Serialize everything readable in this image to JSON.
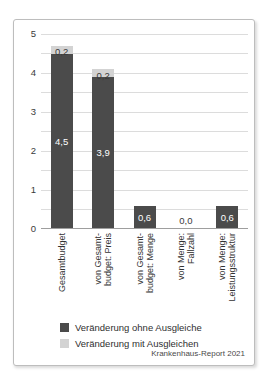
{
  "card": {
    "border_color": "#bdbdbd",
    "background": "#ffffff"
  },
  "chart_data": {
    "type": "bar",
    "stacked": true,
    "categories": [
      "Gesamtbudget",
      "von Gesamtbudget: Preis",
      "von Gesamtbudget: Menge",
      "von Menge: Fallzahl",
      "von Menge: Leistungsstruktur"
    ],
    "category_display_lines": [
      [
        "Gesamtbudget"
      ],
      [
        "von Gesamt-",
        "budget: Preis"
      ],
      [
        "von Gesamt-",
        "budget: Menge"
      ],
      [
        "von Menge:",
        "Fallzahl"
      ],
      [
        "von Menge:",
        "Leistungsstruktur"
      ]
    ],
    "series": [
      {
        "name": "Veränderung ohne Ausgleiche",
        "color": "#4b4b4b",
        "values": [
          4.5,
          3.9,
          0.6,
          0.0,
          0.6
        ],
        "labels": [
          "4,5",
          "3,9",
          "0,6",
          "0,0",
          "0,6"
        ],
        "label_color_inside": "#ffffff",
        "label_color_outside": "#3a3a3a"
      },
      {
        "name": "Veränderung mit Ausgleichen",
        "color": "#d3d3d3",
        "values": [
          0.2,
          0.2,
          0.0,
          0.0,
          0.0
        ],
        "labels": [
          "0,2",
          "0,2",
          "",
          "",
          ""
        ],
        "label_color": "#3a3a3a"
      }
    ],
    "ylim": [
      0,
      5
    ],
    "ytick_labels": [
      "0",
      "1",
      "2",
      "3",
      "4",
      "5"
    ],
    "grid_step": 0.5,
    "grid_on": true,
    "grid_color": "#dcdcdc",
    "axis_color": "#9e9e9e",
    "legend_position": "bottom-left",
    "legend": [
      {
        "label": "Veränderung ohne Ausgleiche",
        "color": "#4b4b4b"
      },
      {
        "label": "Veränderung mit Ausgleichen",
        "color": "#d3d3d3"
      }
    ],
    "source": "Krankenhaus-Report 2021"
  }
}
